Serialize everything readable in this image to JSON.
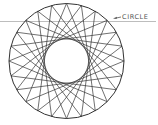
{
  "diagram": {
    "label": "CIRCLE",
    "circle": {
      "cx": 66.5,
      "cy": 61,
      "r": 57.5
    },
    "star": {
      "points": 24,
      "step": 9
    },
    "colors": {
      "stroke": "#333333",
      "guide_line": "#bdbdbd",
      "label": "#555555"
    },
    "guide_line": {
      "y": 21.5,
      "x1": 0,
      "x2": 156
    },
    "leader": {
      "x1": 121,
      "y1": 17,
      "x2": 113,
      "y2": 18.5
    }
  }
}
